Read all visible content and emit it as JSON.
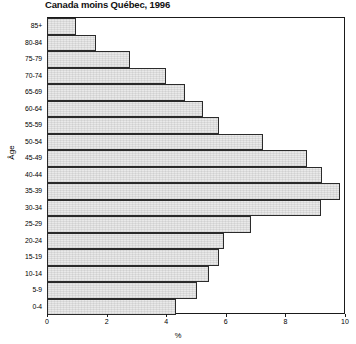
{
  "chart": {
    "title_line1": "Profil selon l'âge, population de langue maternelle française",
    "title_line2": "Canada moins Québec, 1996",
    "ylabel": "Âge",
    "xlabel": "%"
  },
  "chart_data": {
    "type": "bar",
    "orientation": "horizontal",
    "xlabel": "%",
    "ylabel": "Âge",
    "xlim": [
      0,
      10
    ],
    "xticks": [
      0,
      2,
      4,
      6,
      8,
      10
    ],
    "xtick_labels": [
      "0",
      "2",
      "4",
      "6",
      "8",
      "10"
    ],
    "grid": false,
    "legend": "none",
    "bar_fill": "#e9e9e9",
    "bar_edge": "#2b2b2b",
    "categories": [
      "85+",
      "80-84",
      "75-79",
      "70-74",
      "65-69",
      "60-64",
      "55-59",
      "50-54",
      "45-49",
      "40-44",
      "35-39",
      "30-34",
      "25-29",
      "20-24",
      "15-19",
      "10-14",
      "5-9",
      "0-4"
    ],
    "values": [
      0.95,
      1.6,
      2.75,
      3.95,
      4.6,
      5.2,
      5.75,
      7.2,
      8.7,
      9.2,
      9.8,
      9.15,
      6.8,
      5.9,
      5.75,
      5.4,
      5.0,
      4.3
    ]
  }
}
